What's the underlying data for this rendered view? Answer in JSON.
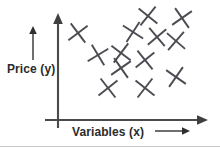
{
  "figure": {
    "title": "",
    "background_color": "#ffffff",
    "width": 220,
    "height": 147
  },
  "labels": {
    "y_axis": "Price (y)",
    "x_axis": "Variables (x)"
  },
  "icons": {
    "y_pointer_arrow": "up-arrow-icon",
    "x_pointer_arrow": "right-arrow-icon",
    "y_axis_arrow": "axis-up-arrow-icon",
    "x_axis_arrow": "axis-right-arrow-icon"
  },
  "colors": {
    "marker": "#4b4b52",
    "axis": "#4a4a4a",
    "text": "#2b2b2b",
    "background": "#ffffff",
    "border": "#c8c8c8"
  },
  "chart_data": {
    "type": "scatter",
    "title": "",
    "subtitle": "",
    "xlabel": "Variables (x)",
    "ylabel": "Price (y)",
    "xlim": [
      0,
      220
    ],
    "ylim": [
      0,
      147
    ],
    "grid": false,
    "legend": null,
    "axes": {
      "y_axis_x": 58,
      "y_axis_top": 14,
      "y_axis_bottom": 128,
      "x_axis_y": 120,
      "x_axis_left": 45,
      "x_axis_right": 208,
      "arrowheads": [
        "up",
        "right"
      ]
    },
    "marker_style": {
      "shape": "x-cross",
      "size": 17,
      "rotation_jitter": true,
      "stroke_width": 1.9
    },
    "points": [
      {
        "x": 78,
        "y": 33,
        "rot": 8
      },
      {
        "x": 148,
        "y": 16,
        "rot": -6
      },
      {
        "x": 182,
        "y": 18,
        "rot": 10
      },
      {
        "x": 133,
        "y": 32,
        "rot": -12
      },
      {
        "x": 157,
        "y": 37,
        "rot": 5
      },
      {
        "x": 176,
        "y": 41,
        "rot": -4
      },
      {
        "x": 98,
        "y": 55,
        "rot": 14
      },
      {
        "x": 121,
        "y": 53,
        "rot": -8
      },
      {
        "x": 145,
        "y": 60,
        "rot": 6
      },
      {
        "x": 121,
        "y": 68,
        "rot": 10
      },
      {
        "x": 176,
        "y": 77,
        "rot": -10
      },
      {
        "x": 108,
        "y": 88,
        "rot": 7
      },
      {
        "x": 145,
        "y": 88,
        "rot": -7
      }
    ],
    "annotations": [
      {
        "name": "y-direction-arrow",
        "x": 33,
        "y_from": 60,
        "y_to": 27,
        "direction": "up"
      },
      {
        "name": "x-direction-arrow",
        "x_from": 155,
        "x_to": 190,
        "y": 131,
        "direction": "right"
      }
    ]
  }
}
